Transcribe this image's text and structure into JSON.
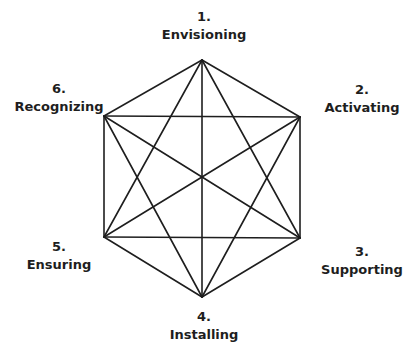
{
  "diagram": {
    "type": "complete-graph-hexagon",
    "line_color": "#1e1e1e",
    "nodes": [
      {
        "number": "1.",
        "name": "Envisioning",
        "x": 202,
        "y": 60,
        "label_x": 204,
        "label_y": 8
      },
      {
        "number": "2.",
        "name": "Activating",
        "x": 300,
        "y": 117,
        "label_x": 362,
        "label_y": 81
      },
      {
        "number": "3.",
        "name": "Supporting",
        "x": 300,
        "y": 238,
        "label_x": 362,
        "label_y": 243
      },
      {
        "number": "4.",
        "name": "Installing",
        "x": 202,
        "y": 297,
        "label_x": 204,
        "label_y": 308
      },
      {
        "number": "5.",
        "name": "Ensuring",
        "x": 104,
        "y": 237,
        "label_x": 59,
        "label_y": 238
      },
      {
        "number": "6.",
        "name": "Recognizing",
        "x": 104,
        "y": 116,
        "label_x": 59,
        "label_y": 80
      }
    ]
  }
}
